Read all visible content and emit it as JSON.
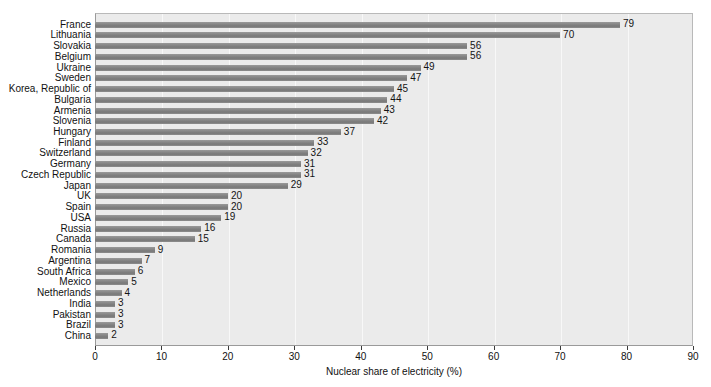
{
  "chart_data": {
    "type": "bar",
    "orientation": "horizontal",
    "title": "",
    "xlabel": "Nuclear share of electricity (%)",
    "ylabel": "",
    "xlim": [
      0,
      90
    ],
    "xticks": [
      0,
      10,
      20,
      30,
      40,
      50,
      60,
      70,
      80,
      90
    ],
    "grid": true,
    "legend": null,
    "categories": [
      "France",
      "Lithuania",
      "Slovakia",
      "Belgium",
      "Ukraine",
      "Sweden",
      "Korea, Republic of",
      "Bulgaria",
      "Armenia",
      "Slovenia",
      "Hungary",
      "Finland",
      "Switzerland",
      "Germany",
      "Czech Republic",
      "Japan",
      "UK",
      "Spain",
      "USA",
      "Russia",
      "Canada",
      "Romania",
      "Argentina",
      "South Africa",
      "Mexico",
      "Netherlands",
      "India",
      "Pakistan",
      "Brazil",
      "China"
    ],
    "values": [
      79,
      70,
      56,
      56,
      49,
      47,
      45,
      44,
      43,
      42,
      37,
      33,
      32,
      31,
      31,
      29,
      20,
      20,
      19,
      16,
      15,
      9,
      7,
      6,
      5,
      4,
      3,
      3,
      3,
      2
    ],
    "value_labels": [
      "79",
      "70",
      "56",
      "56",
      "49",
      "47",
      "45",
      "44",
      "43",
      "42",
      "37",
      "33",
      "32",
      "31",
      "31",
      "29",
      "20",
      "20",
      "19",
      "16",
      "15",
      "9",
      "7",
      "6",
      "5",
      "4",
      "3",
      "3",
      "3",
      "2"
    ],
    "colors": {
      "bar": "#828282",
      "plot_background": "#ebebeb",
      "page_background": "#ffffff",
      "gridline": "#f8f8f8",
      "axis": "#3a3a3a",
      "text": "#111111"
    }
  }
}
